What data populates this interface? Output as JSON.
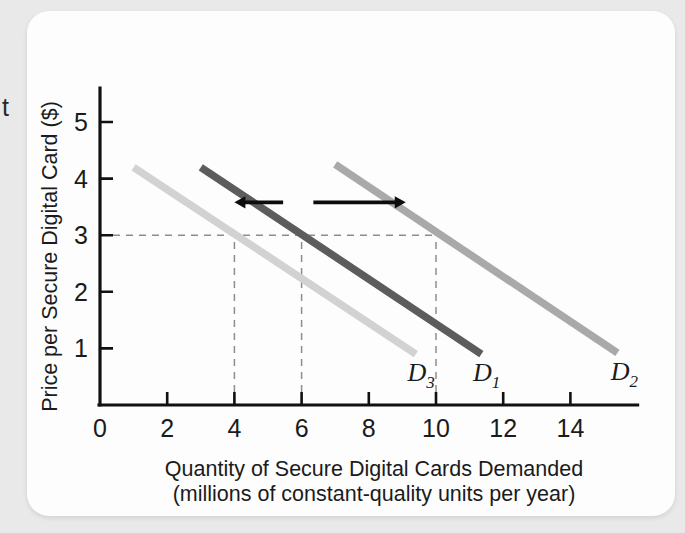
{
  "bleed": {
    "letter": "t"
  },
  "chart_data": {
    "type": "line",
    "title": "",
    "xlabel_line1": "Quantity of Secure Digital Cards Demanded",
    "xlabel_line2": "(millions of constant-quality units per year)",
    "ylabel": "Price per Secure Digital Card ($)",
    "xlim": [
      0,
      16
    ],
    "ylim": [
      0,
      5.6
    ],
    "xticks": [
      0,
      2,
      4,
      6,
      8,
      10,
      12,
      14
    ],
    "xticklabels": [
      "0",
      "2",
      "4",
      "6",
      "8",
      "10",
      "12",
      "14"
    ],
    "yticks": [
      1,
      2,
      3,
      4,
      5
    ],
    "yticklabels": [
      "1",
      "2",
      "3",
      "4",
      "5"
    ],
    "grid": false,
    "legend": "none",
    "series": [
      {
        "name": "D3",
        "label": "D",
        "subscript": "3",
        "color": "#d2d2d2",
        "points": [
          [
            1.0,
            4.2
          ],
          [
            9.4,
            0.9
          ]
        ],
        "label_x": 9.15,
        "label_y": 0.42
      },
      {
        "name": "D1",
        "label": "D",
        "subscript": "1",
        "color": "#5c5c5c",
        "points": [
          [
            3.0,
            4.2
          ],
          [
            11.35,
            0.9
          ]
        ],
        "label_x": 11.1,
        "label_y": 0.42
      },
      {
        "name": "D2",
        "label": "D",
        "subscript": "2",
        "color": "#a9a9a9",
        "points": [
          [
            7.0,
            4.25
          ],
          [
            15.4,
            0.92
          ]
        ],
        "label_x": 15.2,
        "label_y": 0.45
      }
    ],
    "reference_lines": {
      "horizontal": {
        "price": 3,
        "from_quantity": 0,
        "to_quantity": 10
      },
      "vertical": [
        {
          "quantity": 4,
          "from_price": 0,
          "to_price": 3
        },
        {
          "quantity": 6,
          "from_price": 0,
          "to_price": 3
        },
        {
          "quantity": 10,
          "from_price": 0,
          "to_price": 3
        }
      ]
    },
    "annotations": [
      {
        "name": "decrease-in-demand-arrow",
        "direction": "left",
        "from_quantity": 5.45,
        "to_quantity": 4.0,
        "price": 3.58
      },
      {
        "name": "increase-in-demand-arrow",
        "direction": "right",
        "from_quantity": 6.35,
        "to_quantity": 9.1,
        "price": 3.58
      }
    ]
  }
}
